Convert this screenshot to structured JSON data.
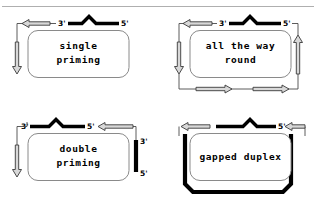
{
  "figure": {
    "top_rule": true,
    "background": "#ffffff",
    "ink": "#000000",
    "box_stroke": "#8a8a8a",
    "arrow_fill": "#d8d8d8",
    "arrow_stroke": "#3a3a3a"
  },
  "panels": [
    {
      "id": "single-priming",
      "label": "single\npriming",
      "label_line1": "single",
      "label_line2": "priming",
      "template": {
        "style": "thin-bar-with-peak",
        "left_end": "3'",
        "right_end": "5'"
      },
      "arrows": [
        {
          "name": "top-left-arrow",
          "direction": "left"
        },
        {
          "name": "left-down-arrow",
          "direction": "down"
        }
      ],
      "end_labels": [
        "3'",
        "5'"
      ]
    },
    {
      "id": "all-the-way-round",
      "label": "all the way\nround",
      "label_line1": "all the way",
      "label_line2": "round",
      "template": {
        "style": "thin-bar-with-peak",
        "left_end": "3'",
        "right_end": "5'"
      },
      "arrows": [
        {
          "name": "top-left-arrow",
          "direction": "left"
        },
        {
          "name": "left-down-arrow",
          "direction": "down"
        },
        {
          "name": "bottom-left-right-arrow",
          "direction": "right"
        },
        {
          "name": "bottom-right-right-arrow",
          "direction": "right"
        },
        {
          "name": "right-up-arrow",
          "direction": "up"
        }
      ],
      "end_labels": [
        "3'",
        "5'"
      ]
    },
    {
      "id": "double-priming",
      "label": "double\npriming",
      "label_line1": "double",
      "label_line2": "priming",
      "template": {
        "style": "thin-bar-with-peak",
        "left_end": "3'",
        "right_end": "5'"
      },
      "secondary_template": {
        "style": "vertical-bar",
        "top_end": "3'",
        "bottom_end": "5'"
      },
      "arrows": [
        {
          "name": "left-down-arrow",
          "direction": "down"
        },
        {
          "name": "top-right-left-arrow",
          "direction": "left"
        }
      ],
      "end_labels": [
        "3'",
        "5'",
        "3'",
        "5'"
      ]
    },
    {
      "id": "gapped-duplex",
      "label": "gapped duplex",
      "label_line1": "gapped duplex",
      "label_line2": "",
      "template": {
        "style": "thin-bar-with-peak",
        "left_end": "",
        "right_end": "5'"
      },
      "secondary_template": {
        "style": "u-shape-thick"
      },
      "arrows": [
        {
          "name": "top-left-arrow",
          "direction": "left"
        },
        {
          "name": "top-right-arrow",
          "direction": "left"
        }
      ],
      "end_labels": [
        "5'"
      ]
    }
  ],
  "end_marks": {
    "three_prime": "3'",
    "five_prime": "5'"
  }
}
